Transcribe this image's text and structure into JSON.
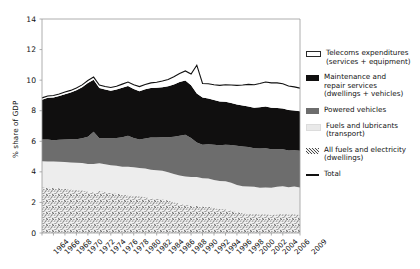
{
  "chart_data": {
    "type": "area",
    "title": "",
    "xlabel": "",
    "ylabel": "% share of GDP",
    "ylim": [
      0,
      14
    ],
    "yticks": [
      0,
      2,
      4,
      6,
      8,
      10,
      12,
      14
    ],
    "xlim": [
      1964,
      2009
    ],
    "xticks": [
      1964,
      1966,
      1968,
      1970,
      1972,
      1974,
      1976,
      1978,
      1980,
      1982,
      1984,
      1986,
      1988,
      1990,
      1992,
      1994,
      1996,
      1998,
      2000,
      2002,
      2004,
      2006,
      2009
    ],
    "grid": false,
    "legend_position": "right",
    "stacked": true,
    "x": [
      1964,
      1965,
      1966,
      1967,
      1968,
      1969,
      1970,
      1971,
      1972,
      1973,
      1974,
      1975,
      1976,
      1977,
      1978,
      1979,
      1980,
      1981,
      1982,
      1983,
      1984,
      1985,
      1986,
      1987,
      1988,
      1989,
      1990,
      1991,
      1992,
      1993,
      1994,
      1995,
      1996,
      1997,
      1998,
      1999,
      2000,
      2001,
      2002,
      2003,
      2004,
      2005,
      2006,
      2007,
      2008,
      2009
    ],
    "series": [
      {
        "name": "All fuels and electricity (dwellings)",
        "color": "#cfcfcf",
        "pattern": "speckle",
        "values": [
          3.0,
          2.98,
          2.95,
          2.92,
          2.88,
          2.85,
          2.82,
          2.8,
          2.72,
          2.66,
          2.74,
          2.7,
          2.62,
          2.58,
          2.5,
          2.46,
          2.44,
          2.42,
          2.36,
          2.28,
          2.22,
          2.2,
          2.12,
          2.02,
          1.92,
          1.84,
          1.78,
          1.8,
          1.74,
          1.72,
          1.64,
          1.58,
          1.56,
          1.48,
          1.38,
          1.3,
          1.24,
          1.26,
          1.22,
          1.24,
          1.2,
          1.22,
          1.26,
          1.22,
          1.24,
          1.2
        ]
      },
      {
        "name": "Fuels and lubricants (transport)",
        "color": "#ededed",
        "pattern": "solid",
        "values": [
          1.7,
          1.7,
          1.72,
          1.74,
          1.76,
          1.76,
          1.78,
          1.78,
          1.8,
          1.86,
          1.82,
          1.8,
          1.82,
          1.82,
          1.84,
          1.88,
          1.86,
          1.84,
          1.86,
          1.86,
          1.88,
          1.88,
          1.86,
          1.84,
          1.84,
          1.86,
          1.88,
          1.86,
          1.84,
          1.84,
          1.82,
          1.82,
          1.82,
          1.8,
          1.76,
          1.76,
          1.8,
          1.76,
          1.74,
          1.74,
          1.76,
          1.8,
          1.8,
          1.78,
          1.8,
          1.78
        ]
      },
      {
        "name": "Powered vehicles",
        "color": "#6d6d6d",
        "pattern": "solid",
        "values": [
          1.42,
          1.44,
          1.4,
          1.44,
          1.48,
          1.52,
          1.54,
          1.62,
          1.78,
          2.1,
          1.64,
          1.7,
          1.76,
          1.82,
          1.92,
          2.02,
          1.92,
          1.86,
          1.96,
          2.1,
          2.14,
          2.18,
          2.28,
          2.44,
          2.6,
          2.72,
          2.56,
          2.26,
          2.2,
          2.24,
          2.32,
          2.34,
          2.4,
          2.48,
          2.56,
          2.6,
          2.58,
          2.52,
          2.56,
          2.56,
          2.52,
          2.46,
          2.42,
          2.4,
          2.38,
          2.4
        ]
      },
      {
        "name": "Maintenance and repair services (dwellings + vehicles)",
        "color": "#100f0f",
        "pattern": "solid",
        "values": [
          2.6,
          2.72,
          2.8,
          2.86,
          2.96,
          3.06,
          3.2,
          3.34,
          3.52,
          3.4,
          3.28,
          3.18,
          3.1,
          3.16,
          3.24,
          3.26,
          3.2,
          3.16,
          3.22,
          3.24,
          3.26,
          3.28,
          3.34,
          3.42,
          3.52,
          3.56,
          3.44,
          3.2,
          3.08,
          3.0,
          2.92,
          2.86,
          2.8,
          2.74,
          2.7,
          2.68,
          2.66,
          2.66,
          2.7,
          2.74,
          2.72,
          2.7,
          2.66,
          2.64,
          2.6,
          2.58
        ]
      },
      {
        "name": "Telecoms expenditures (services + equipment)",
        "color": "#ffffff",
        "pattern": "solid",
        "values": [
          0.12,
          0.12,
          0.13,
          0.13,
          0.14,
          0.14,
          0.15,
          0.15,
          0.16,
          0.18,
          0.2,
          0.2,
          0.22,
          0.22,
          0.24,
          0.26,
          0.28,
          0.3,
          0.32,
          0.34,
          0.36,
          0.4,
          0.44,
          0.5,
          0.56,
          0.62,
          0.74,
          0.86,
          0.92,
          0.96,
          1.0,
          1.06,
          1.12,
          1.18,
          1.26,
          1.34,
          1.44,
          1.5,
          1.56,
          1.6,
          1.62,
          1.64,
          1.62,
          1.58,
          1.54,
          1.52
        ]
      }
    ],
    "total_line": {
      "name": "Total",
      "color": "#111111",
      "values": [
        8.84,
        8.96,
        9.0,
        9.09,
        9.22,
        9.33,
        9.49,
        9.69,
        9.98,
        10.2,
        9.68,
        9.58,
        9.52,
        9.6,
        9.74,
        9.88,
        9.7,
        9.58,
        9.72,
        9.82,
        9.86,
        9.94,
        10.04,
        10.22,
        10.44,
        10.6,
        10.4,
        10.98,
        9.78,
        9.76,
        9.7,
        9.66,
        9.7,
        9.68,
        9.66,
        9.68,
        9.72,
        9.7,
        9.78,
        9.88,
        9.82,
        9.82,
        9.76,
        9.62,
        9.56,
        9.48
      ]
    }
  },
  "legend": {
    "items": [
      {
        "key": "telecoms",
        "label": "Telecoms expenditures\n(services + equipment)"
      },
      {
        "key": "maintenance",
        "label": "Maintenance and\nrepair services\n(dwellings + vehicles)"
      },
      {
        "key": "powered-vehicles",
        "label": "Powered vehicles"
      },
      {
        "key": "fuels-lubricants",
        "label": "Fuels and lubricants\n(transport)"
      },
      {
        "key": "all-fuels-electricity",
        "label": "All fuels and electricity\n(dwellings)"
      },
      {
        "key": "total",
        "label": "Total"
      }
    ]
  }
}
